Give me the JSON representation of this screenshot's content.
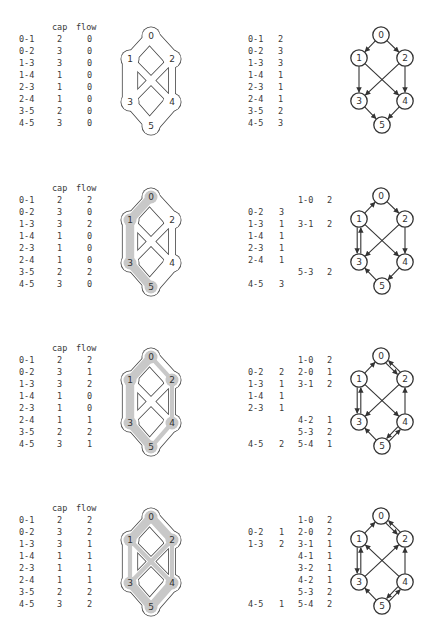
{
  "headers": {
    "cap": "cap",
    "flow": "flow"
  },
  "nodes": [
    "0",
    "1",
    "2",
    "3",
    "4",
    "5"
  ],
  "edges": [
    "0-1",
    "0-2",
    "1-3",
    "1-4",
    "2-3",
    "2-4",
    "3-5",
    "4-5"
  ],
  "colors": {
    "flow_highlight": "#c8c8c8",
    "outline": "#444444",
    "text": "#3a3a3a"
  },
  "steps": [
    {
      "table": [
        {
          "edge": "0-1",
          "cap": "2",
          "flow": "0"
        },
        {
          "edge": "0-2",
          "cap": "3",
          "flow": "0"
        },
        {
          "edge": "1-3",
          "cap": "3",
          "flow": "0"
        },
        {
          "edge": "1-4",
          "cap": "1",
          "flow": "0"
        },
        {
          "edge": "2-3",
          "cap": "1",
          "flow": "0"
        },
        {
          "edge": "2-4",
          "cap": "1",
          "flow": "0"
        },
        {
          "edge": "3-5",
          "cap": "2",
          "flow": "0"
        },
        {
          "edge": "4-5",
          "cap": "3",
          "flow": "0"
        }
      ],
      "residual_forward": [
        {
          "row": 0,
          "edge": "0-1",
          "value": "2"
        },
        {
          "row": 1,
          "edge": "0-2",
          "value": "3"
        },
        {
          "row": 2,
          "edge": "1-3",
          "value": "3"
        },
        {
          "row": 3,
          "edge": "1-4",
          "value": "1"
        },
        {
          "row": 4,
          "edge": "2-3",
          "value": "1"
        },
        {
          "row": 5,
          "edge": "2-4",
          "value": "1"
        },
        {
          "row": 6,
          "edge": "3-5",
          "value": "2"
        },
        {
          "row": 7,
          "edge": "4-5",
          "value": "3"
        }
      ],
      "residual_backward": []
    },
    {
      "table": [
        {
          "edge": "0-1",
          "cap": "2",
          "flow": "2"
        },
        {
          "edge": "0-2",
          "cap": "3",
          "flow": "0"
        },
        {
          "edge": "1-3",
          "cap": "3",
          "flow": "2"
        },
        {
          "edge": "1-4",
          "cap": "1",
          "flow": "0"
        },
        {
          "edge": "2-3",
          "cap": "1",
          "flow": "0"
        },
        {
          "edge": "2-4",
          "cap": "1",
          "flow": "0"
        },
        {
          "edge": "3-5",
          "cap": "2",
          "flow": "2"
        },
        {
          "edge": "4-5",
          "cap": "3",
          "flow": "0"
        }
      ],
      "residual_forward": [
        {
          "row": 1,
          "edge": "0-2",
          "value": "3"
        },
        {
          "row": 2,
          "edge": "1-3",
          "value": "1"
        },
        {
          "row": 3,
          "edge": "1-4",
          "value": "1"
        },
        {
          "row": 4,
          "edge": "2-3",
          "value": "1"
        },
        {
          "row": 5,
          "edge": "2-4",
          "value": "1"
        },
        {
          "row": 7,
          "edge": "4-5",
          "value": "3"
        }
      ],
      "residual_backward": [
        {
          "row": 0,
          "edge": "1-0",
          "value": "2"
        },
        {
          "row": 2,
          "edge": "3-1",
          "value": "2"
        },
        {
          "row": 6,
          "edge": "5-3",
          "value": "2"
        }
      ]
    },
    {
      "table": [
        {
          "edge": "0-1",
          "cap": "2",
          "flow": "2"
        },
        {
          "edge": "0-2",
          "cap": "3",
          "flow": "1"
        },
        {
          "edge": "1-3",
          "cap": "3",
          "flow": "2"
        },
        {
          "edge": "1-4",
          "cap": "1",
          "flow": "0"
        },
        {
          "edge": "2-3",
          "cap": "1",
          "flow": "0"
        },
        {
          "edge": "2-4",
          "cap": "1",
          "flow": "1"
        },
        {
          "edge": "3-5",
          "cap": "2",
          "flow": "2"
        },
        {
          "edge": "4-5",
          "cap": "3",
          "flow": "1"
        }
      ],
      "residual_forward": [
        {
          "row": 1,
          "edge": "0-2",
          "value": "2"
        },
        {
          "row": 2,
          "edge": "1-3",
          "value": "1"
        },
        {
          "row": 3,
          "edge": "1-4",
          "value": "1"
        },
        {
          "row": 4,
          "edge": "2-3",
          "value": "1"
        },
        {
          "row": 7,
          "edge": "4-5",
          "value": "2"
        }
      ],
      "residual_backward": [
        {
          "row": 0,
          "edge": "1-0",
          "value": "2"
        },
        {
          "row": 1,
          "edge": "2-0",
          "value": "1"
        },
        {
          "row": 2,
          "edge": "3-1",
          "value": "2"
        },
        {
          "row": 5,
          "edge": "4-2",
          "value": "1"
        },
        {
          "row": 6,
          "edge": "5-3",
          "value": "2"
        },
        {
          "row": 7,
          "edge": "5-4",
          "value": "1"
        }
      ]
    },
    {
      "table": [
        {
          "edge": "0-1",
          "cap": "2",
          "flow": "2"
        },
        {
          "edge": "0-2",
          "cap": "3",
          "flow": "2"
        },
        {
          "edge": "1-3",
          "cap": "3",
          "flow": "1"
        },
        {
          "edge": "1-4",
          "cap": "1",
          "flow": "1"
        },
        {
          "edge": "2-3",
          "cap": "1",
          "flow": "1"
        },
        {
          "edge": "2-4",
          "cap": "1",
          "flow": "1"
        },
        {
          "edge": "3-5",
          "cap": "2",
          "flow": "2"
        },
        {
          "edge": "4-5",
          "cap": "3",
          "flow": "2"
        }
      ],
      "residual_forward": [
        {
          "row": 1,
          "edge": "0-2",
          "value": "1"
        },
        {
          "row": 2,
          "edge": "1-3",
          "value": "2"
        },
        {
          "row": 7,
          "edge": "4-5",
          "value": "1"
        }
      ],
      "residual_backward": [
        {
          "row": 0,
          "edge": "1-0",
          "value": "2"
        },
        {
          "row": 1,
          "edge": "2-0",
          "value": "2"
        },
        {
          "row": 2,
          "edge": "3-1",
          "value": "1"
        },
        {
          "row": 3,
          "edge": "4-1",
          "value": "1"
        },
        {
          "row": 4,
          "edge": "3-2",
          "value": "1"
        },
        {
          "row": 5,
          "edge": "4-2",
          "value": "1"
        },
        {
          "row": 6,
          "edge": "5-3",
          "value": "2"
        },
        {
          "row": 7,
          "edge": "5-4",
          "value": "2"
        }
      ]
    }
  ]
}
